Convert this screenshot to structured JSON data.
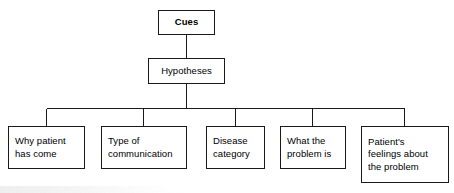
{
  "diagram": {
    "orientation": "top-down",
    "line_color": "#1a1a1a",
    "box_fill": "#ffffff",
    "text_color": "#000000",
    "root": {
      "label": "Cues"
    },
    "level2": {
      "label": "Hypotheses"
    },
    "leaves": [
      {
        "label": "Why patient\nhas come"
      },
      {
        "label": "Type of\ncommunication"
      },
      {
        "label": "Disease\ncategory"
      },
      {
        "label": "What the\nproblem is"
      },
      {
        "label": "Patient's\nfeelings about\nthe problem"
      }
    ]
  }
}
